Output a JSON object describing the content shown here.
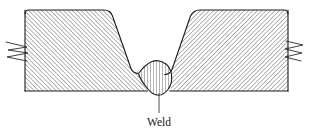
{
  "figure": {
    "kind": "engineering-cross-section-drawing",
    "background_color": "#ffffff",
    "line_color": "#1a1a1a"
  },
  "labels": {
    "weld": "Weld"
  },
  "annotations": [
    {
      "name": "weld-callout",
      "text": "Weld",
      "text_x": 159,
      "text_y": 124,
      "leader_from_x": 159,
      "leader_from_y": 114,
      "leader_to_x": 159,
      "leader_to_y": 93
    }
  ],
  "geometry": {
    "plate_top_y": 10,
    "plate_bottom_y": 91,
    "plate_left_x": 25,
    "plate_right_x": 288,
    "corner_radius": 4,
    "left_plate_outline": "M 25,14 Q 25,10 29,10 L 104,10 Q 110,10 112,15 L 131,69 Q 133,74 138,74 L 25,74 Z",
    "right_plate_outline": "M 288,14 Q 288,10 284,10 L 200,10 Q 194,10 191,15 L 172,70 Q 170,75 165,75 L 288,75 Z",
    "weld_bead_outline": "M 138,74 Q 152,60 166,75 Q 170,86 166,92 Q 159,98 152,92 Q 138,84 138,74 Z",
    "root_bulge_center_x": 159,
    "root_bulge_bottom_y": 95
  },
  "hatching": {
    "left_plate": {
      "name": "diagonal-hatch-up-right",
      "angle_deg": -45,
      "spacing_px": 3.1,
      "stroke_width": 0.65,
      "color": "#1e1e1e"
    },
    "right_plate": {
      "name": "diagonal-hatch-down-right",
      "angle_deg": 45,
      "spacing_px": 3.1,
      "stroke_width": 0.65,
      "color": "#1e1e1e"
    },
    "weld_bead": {
      "name": "vertical-hatch",
      "angle_deg": 90,
      "spacing_px": 3.0,
      "stroke_width": 0.7,
      "color": "#1e1e1e"
    }
  },
  "break_symbols": [
    {
      "name": "break-line-left",
      "side": "left",
      "x": 25,
      "y": 50
    },
    {
      "name": "break-line-right",
      "side": "right",
      "x": 288,
      "y": 50
    }
  ]
}
